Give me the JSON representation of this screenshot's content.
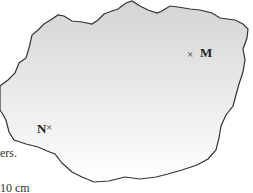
{
  "diagram": {
    "shape": "irregular closed region (island/field outline) with gradient grey fill",
    "fill_colors": {
      "top": "#d6d6d6",
      "bottom": "#ffffff"
    },
    "outline_color": "#333333",
    "points": [
      {
        "label": "M",
        "marker": "×"
      },
      {
        "label": "N",
        "marker": "×"
      }
    ],
    "text_fragments": [
      "ers.",
      "10 cm"
    ]
  }
}
